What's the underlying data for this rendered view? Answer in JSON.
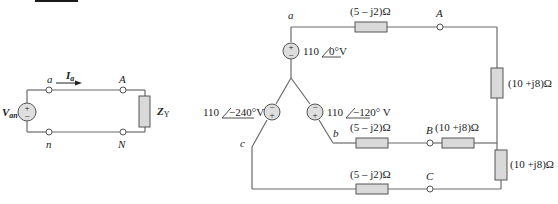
{
  "header_bar": {
    "color": "#1a1a1a"
  },
  "single_phase": {
    "source_label": "V",
    "source_sub": "an",
    "current_label": "I",
    "current_sub": "a",
    "node_a": "a",
    "node_n": "n",
    "node_A": "A",
    "node_N": "N",
    "load_label": "Z",
    "load_sub": "Y"
  },
  "three_phase": {
    "nodes": {
      "a": "a",
      "b": "b",
      "c": "c",
      "A": "A",
      "B": "B",
      "C": "C"
    },
    "sources": {
      "a": "110∠ 0°V",
      "a_mag": "110",
      "a_ang": "0°",
      "a_unit": "V",
      "b_mag": "110",
      "b_ang": "−120°",
      "b_unit": " V",
      "c_mag": "110",
      "c_ang": "−240°",
      "c_unit": "V"
    },
    "line_impedances": {
      "a": "(5 – j2)Ω",
      "b": "(5 – j2)Ω",
      "c": "(5 – j2)Ω"
    },
    "load_impedances": {
      "A": "(10 +j8)Ω",
      "B": "(10 +j8)Ω",
      "C": "(10 +j8)Ω"
    }
  },
  "symbols": {
    "plus": "+",
    "minus": "−"
  },
  "colors": {
    "wire": "#6b6b6b",
    "component_fill": "#d9d9d9",
    "outline": "#555555"
  }
}
